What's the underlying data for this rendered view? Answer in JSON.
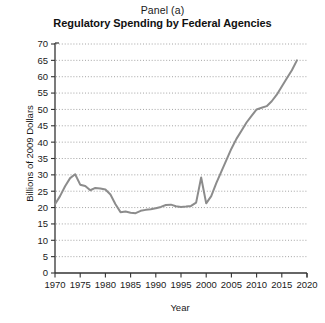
{
  "figure": {
    "panel_label": "Panel (a)",
    "title": "Regulatory Spending by Federal Agencies",
    "xlabel": "Year",
    "ylabel": "Billions of 2009 Dollars",
    "line_color": "#8c8c8c",
    "axis_color": "#333333",
    "grid_color": "#9a9a9a",
    "background_color": "#ffffff"
  },
  "chart_data": {
    "type": "line",
    "title": "Regulatory Spending by Federal Agencies",
    "subtitle": "Panel (a)",
    "xlabel": "Year",
    "ylabel": "Billions of 2009 Dollars",
    "xlim": [
      1970,
      2020
    ],
    "ylim": [
      0,
      70
    ],
    "xticks": [
      1970,
      1975,
      1980,
      1985,
      1990,
      1995,
      2000,
      2005,
      2010,
      2015,
      2020
    ],
    "yticks": [
      0,
      5,
      10,
      15,
      20,
      25,
      30,
      35,
      40,
      45,
      50,
      55,
      60,
      65,
      70
    ],
    "grid": "horizontal-dotted",
    "legend": "none",
    "series": [
      {
        "name": "Regulatory Spending",
        "color": "#8c8c8c",
        "x": [
          1970,
          1971,
          1972,
          1973,
          1974,
          1975,
          1976,
          1977,
          1978,
          1979,
          1980,
          1981,
          1982,
          1983,
          1984,
          1985,
          1986,
          1987,
          1988,
          1989,
          1990,
          1991,
          1992,
          1993,
          1994,
          1995,
          1996,
          1997,
          1998,
          1999,
          2000,
          2001,
          2002,
          2003,
          2004,
          2005,
          2006,
          2007,
          2008,
          2009,
          2010,
          2011,
          2012,
          2013,
          2014,
          2015,
          2016,
          2017,
          2018
        ],
        "values": [
          21.0,
          23.5,
          26.5,
          29.0,
          30.2,
          27.0,
          26.6,
          25.3,
          26.0,
          25.8,
          25.5,
          24.0,
          21.0,
          18.6,
          18.8,
          18.4,
          18.3,
          19.0,
          19.3,
          19.5,
          19.8,
          20.2,
          20.8,
          20.9,
          20.4,
          20.2,
          20.3,
          20.5,
          21.5,
          29.2,
          21.3,
          23.5,
          27.5,
          31.0,
          34.5,
          38.0,
          41.0,
          43.5,
          46.0,
          48.0,
          50.0,
          50.5,
          51.0,
          52.5,
          54.5,
          57.0,
          59.5,
          62.0,
          65.0
        ]
      }
    ]
  }
}
